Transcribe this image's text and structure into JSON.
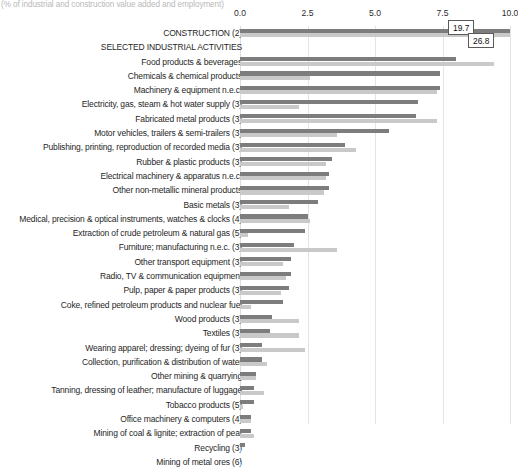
{
  "subtitle": "(% of industrial and construction value added and employment)",
  "axis": {
    "ticks": [
      "0.0",
      "2.5",
      "5.0",
      "7.5",
      "10.0"
    ],
    "min": 0.0,
    "max": 10.0
  },
  "callouts": {
    "value_added": "19.7",
    "employment": "26.8"
  },
  "colors": {
    "value_added": "#7d7d7d",
    "employment": "#c9c9c9",
    "gridline": "#e3e3e8",
    "subtitle": "#b9b9b9"
  },
  "chart_data": {
    "type": "bar",
    "orientation": "horizontal",
    "title": "",
    "subtitle": "(% of industrial and construction value added and employment)",
    "xlabel": "",
    "ylabel": "",
    "xlim": [
      0.0,
      10.0
    ],
    "grid": true,
    "legend_position": "none",
    "categories": [
      "CONSTRUCTION (2)",
      "SELECTED INDUSTRIAL ACTIVITIES",
      "Food products & beverages",
      "Chemicals & chemical products",
      "Machinery & equipment n.e.c.",
      "Electricity, gas, steam & hot water supply (3)",
      "Fabricated metal products (3)",
      "Motor vehicles, trailers & semi-trailers (3)",
      "Publishing, printing, reproduction of recorded media (3)",
      "Rubber & plastic products (3)",
      "Electrical machinery & apparatus n.e.c.",
      "Other non-metallic mineral products",
      "Basic metals (3)",
      "Medical, precision & optical instruments, watches & clocks (4)",
      "Extraction of crude petroleum & natural gas (5)",
      "Furniture; manufacturing n.e.c. (3)",
      "Other transport equipment (3)",
      "Radio, TV & communication equipment",
      "Pulp, paper & paper products (3)",
      "Coke, refined petroleum products and nuclear fuel",
      "Wood products (3)",
      "Textiles (3)",
      "Wearing apparel; dressing; dyeing of fur (3)",
      "Collection, purification & distribution of water",
      "Other mining & quarrying",
      "Tanning, dressing of leather; manufacture of luggage",
      "Tobacco products (5)",
      "Office machinery & computers (4)",
      "Mining of coal & lignite; extraction of peat",
      "Recycling (3)",
      "Mining of metal ores (6)"
    ],
    "series": [
      {
        "name": "Value added",
        "color": "#7d7d7d",
        "values": [
          19.7,
          0.0,
          8.0,
          7.4,
          7.4,
          6.6,
          6.5,
          5.5,
          3.9,
          3.4,
          3.3,
          3.3,
          2.9,
          2.5,
          2.4,
          2.0,
          1.9,
          1.9,
          1.8,
          1.6,
          1.2,
          1.1,
          0.8,
          0.8,
          0.6,
          0.5,
          0.5,
          0.4,
          0.4,
          0.2,
          0.04
        ],
        "overflow_labeled": {
          "CONSTRUCTION (2)": 19.7
        }
      },
      {
        "name": "Employment",
        "color": "#c9c9c9",
        "values": [
          26.8,
          0.0,
          9.4,
          2.6,
          7.3,
          2.2,
          7.3,
          3.6,
          4.3,
          3.2,
          3.2,
          3.1,
          1.8,
          2.6,
          0.3,
          3.6,
          1.6,
          1.7,
          1.5,
          0.4,
          2.2,
          2.2,
          2.4,
          1.0,
          0.6,
          0.9,
          0.1,
          0.4,
          0.5,
          0.05,
          0.02
        ],
        "overflow_labeled": {
          "CONSTRUCTION (2)": 26.8
        }
      }
    ]
  }
}
